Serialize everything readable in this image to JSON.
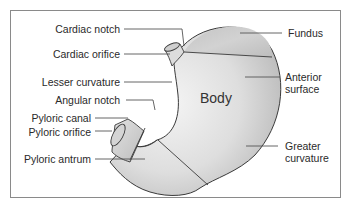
{
  "diagram": {
    "center_label": "Body",
    "labels_left": [
      {
        "id": "cardiac-notch",
        "text": "Cardiac notch"
      },
      {
        "id": "cardiac-orifice",
        "text": "Cardiac orifice"
      },
      {
        "id": "lesser-curvature",
        "text": "Lesser curvature"
      },
      {
        "id": "angular-notch",
        "text": "Angular notch"
      },
      {
        "id": "pyloric-canal",
        "text": "Pyloric canal"
      },
      {
        "id": "pyloric-orifice",
        "text": "Pyloric orifice"
      },
      {
        "id": "pyloric-antrum",
        "text": "Pyloric antrum"
      }
    ],
    "labels_right": [
      {
        "id": "fundus",
        "text": "Fundus"
      },
      {
        "id": "anterior-surface",
        "line1": "Anterior",
        "line2": "surface"
      },
      {
        "id": "greater-curvature",
        "line1": "Greater",
        "line2": "curvature"
      }
    ],
    "colors": {
      "outline": "#3a3a3a",
      "fill_light": "#f2f2f2",
      "fill_mid": "#d6d6d6",
      "fill_dark": "#b8b8b8",
      "frame": "#8a8a8a",
      "text": "#2a2a2a"
    }
  }
}
